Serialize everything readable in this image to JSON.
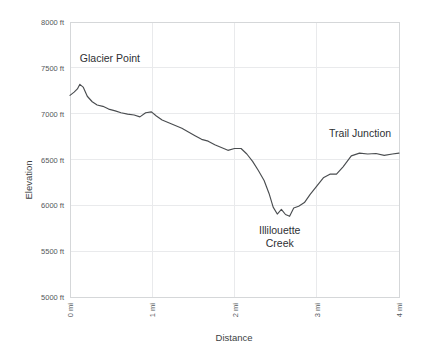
{
  "chart_data": {
    "type": "line",
    "title": "",
    "xlabel": "Distance",
    "ylabel": "Elevation",
    "xlim": [
      0,
      4
    ],
    "ylim": [
      5000,
      8000
    ],
    "grid": true,
    "legend": "none",
    "x_tick_labels": [
      "0 mi",
      "1 mi",
      "2 mi",
      "3 mi",
      "4 mi"
    ],
    "x_tick_values": [
      0,
      1,
      2,
      3,
      4
    ],
    "y_tick_labels": [
      "5000 ft",
      "5500 ft",
      "6000 ft",
      "6500 ft",
      "7000 ft",
      "7500 ft",
      "8000 ft"
    ],
    "y_tick_values": [
      5000,
      5500,
      6000,
      6500,
      7000,
      7500,
      8000
    ],
    "x_tick_rotation": -90,
    "line_color": "#4a4d50",
    "grid_color": "#e9eaec",
    "series": [
      {
        "name": "Elevation profile",
        "x": [
          0.0,
          0.05,
          0.09,
          0.12,
          0.16,
          0.21,
          0.27,
          0.33,
          0.4,
          0.47,
          0.55,
          0.62,
          0.7,
          0.78,
          0.85,
          0.92,
          0.99,
          1.05,
          1.12,
          1.2,
          1.28,
          1.36,
          1.44,
          1.52,
          1.6,
          1.68,
          1.76,
          1.84,
          1.92,
          2.0,
          2.08,
          2.15,
          2.22,
          2.29,
          2.36,
          2.42,
          2.47,
          2.52,
          2.57,
          2.62,
          2.67,
          2.72,
          2.78,
          2.85,
          2.92,
          3.0,
          3.08,
          3.16,
          3.24,
          3.32,
          3.42,
          3.52,
          3.62,
          3.72,
          3.82,
          3.92,
          4.0
        ],
        "y": [
          7200,
          7235,
          7270,
          7320,
          7290,
          7190,
          7130,
          7095,
          7080,
          7050,
          7030,
          7010,
          6995,
          6985,
          6965,
          7010,
          7020,
          6975,
          6930,
          6900,
          6870,
          6840,
          6800,
          6760,
          6720,
          6700,
          6660,
          6630,
          6600,
          6620,
          6620,
          6560,
          6480,
          6380,
          6270,
          6130,
          5980,
          5905,
          5955,
          5900,
          5880,
          5970,
          5990,
          6030,
          6120,
          6210,
          6300,
          6340,
          6340,
          6420,
          6540,
          6570,
          6560,
          6565,
          6545,
          6560,
          6570
        ]
      }
    ],
    "annotations": [
      {
        "name": "glacier-point",
        "text": "Glacier Point",
        "lines": [
          "Glacier Point"
        ],
        "x": 0.12,
        "y": 7560,
        "anchor": "start"
      },
      {
        "name": "illilouette-creek",
        "text": "Illilouette Creek",
        "lines": [
          "Illilouette",
          "Creek"
        ],
        "x": 2.55,
        "y": 5690,
        "anchor": "middle"
      },
      {
        "name": "trail-junction",
        "text": "Trail Junction",
        "lines": [
          "Trail Junction"
        ],
        "x": 3.15,
        "y": 6750,
        "anchor": "start"
      }
    ]
  }
}
